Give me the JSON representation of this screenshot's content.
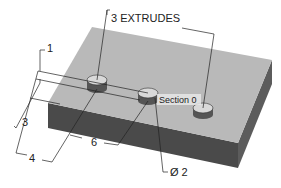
{
  "figure": {
    "type": "isometric-dimensioned-part",
    "labels": {
      "extrudes": "3 EXTRUDES",
      "section": "Section 0",
      "dim_top": "1",
      "dim_left": "3",
      "dim_bottom_left": "4",
      "dim_bottom_mid": "6",
      "diameter": "Ø 2"
    },
    "colors": {
      "top_face": "#b9b9b9",
      "front_face": "#4a4a4a",
      "side_face": "#5e5e5e",
      "boss_top": "#d9d9d9",
      "boss_side": "#555555",
      "line": "#222222",
      "section_label_bg": "#e6e6e6"
    }
  }
}
